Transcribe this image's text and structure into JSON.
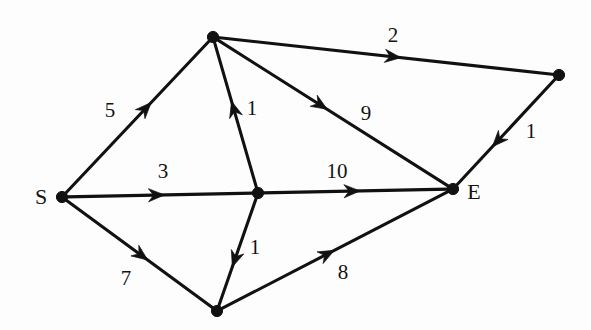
{
  "figure": {
    "kind": "directed-weighted-graph",
    "background_color": "#fdfdfd",
    "ink_color": "#111111",
    "width": 591,
    "height": 330
  },
  "chart_data": {
    "type": "diagram",
    "title": "",
    "xlabel": "",
    "ylabel": "",
    "nodes": [
      {
        "id": "S",
        "label": "S",
        "x": 62,
        "y": 197,
        "label_x": 41,
        "label_y": 197,
        "label_pos": "left"
      },
      {
        "id": "T",
        "label": "",
        "x": 213,
        "y": 37,
        "label_x": 213,
        "label_y": 37,
        "label_pos": "none"
      },
      {
        "id": "C",
        "label": "",
        "x": 258,
        "y": 193,
        "label_x": 258,
        "label_y": 193,
        "label_pos": "none"
      },
      {
        "id": "B",
        "label": "",
        "x": 217,
        "y": 311,
        "label_x": 217,
        "label_y": 311,
        "label_pos": "none"
      },
      {
        "id": "E",
        "label": "E",
        "x": 453,
        "y": 189,
        "label_x": 474,
        "label_y": 192,
        "label_pos": "right"
      },
      {
        "id": "R",
        "label": "",
        "x": 559,
        "y": 75,
        "label_x": 559,
        "label_y": 75,
        "label_pos": "none"
      }
    ],
    "edges": [
      {
        "from": "S",
        "to": "T",
        "weight": "5",
        "label_x": 110,
        "label_y": 110,
        "arrow_t": 0.57
      },
      {
        "from": "S",
        "to": "C",
        "weight": "3",
        "label_x": 163,
        "label_y": 171,
        "arrow_t": 0.5
      },
      {
        "from": "S",
        "to": "B",
        "weight": "7",
        "label_x": 126,
        "label_y": 278,
        "arrow_t": 0.53
      },
      {
        "from": "C",
        "to": "T",
        "weight": "1",
        "label_x": 252,
        "label_y": 108,
        "arrow_t": 0.56
      },
      {
        "from": "C",
        "to": "B",
        "weight": "1",
        "label_x": 255,
        "label_y": 247,
        "arrow_t": 0.59
      },
      {
        "from": "C",
        "to": "E",
        "weight": "10",
        "label_x": 337,
        "label_y": 171,
        "arrow_t": 0.5
      },
      {
        "from": "T",
        "to": "R",
        "weight": "2",
        "label_x": 393,
        "label_y": 35,
        "arrow_t": 0.53
      },
      {
        "from": "T",
        "to": "E",
        "weight": "9",
        "label_x": 366,
        "label_y": 113,
        "arrow_t": 0.46
      },
      {
        "from": "R",
        "to": "E",
        "weight": "1",
        "label_x": 531,
        "label_y": 131,
        "arrow_t": 0.6
      },
      {
        "from": "B",
        "to": "E",
        "weight": "8",
        "label_x": 343,
        "label_y": 272,
        "arrow_t": 0.48
      }
    ],
    "weights": [
      "5",
      "3",
      "7",
      "1",
      "1",
      "10",
      "2",
      "9",
      "1",
      "8"
    ],
    "node_labels": [
      "S",
      "E"
    ],
    "legend": [],
    "grid": false
  }
}
